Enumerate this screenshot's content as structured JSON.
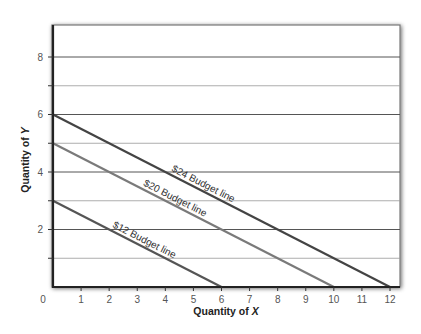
{
  "chart_data": {
    "type": "line",
    "title": "",
    "xlabel": "Quantity of X",
    "ylabel": "Quantity of Y",
    "xlim": [
      0,
      12
    ],
    "ylim": [
      0,
      9
    ],
    "x_ticks": [
      0,
      1,
      2,
      3,
      4,
      5,
      6,
      7,
      8,
      9,
      10,
      11,
      12
    ],
    "y_ticks": [
      2,
      4,
      6,
      8
    ],
    "grid": {
      "horizontal": true,
      "vertical": false,
      "y_values": [
        1,
        2,
        3,
        4,
        5,
        6,
        7,
        8
      ]
    },
    "legend": "none (inline labels)",
    "series": [
      {
        "name": "$24 Budget line",
        "x": [
          0,
          12
        ],
        "y": [
          6,
          0
        ],
        "color": "#444444",
        "label_at_x": 4.2
      },
      {
        "name": "$20 Budget line",
        "x": [
          0,
          10
        ],
        "y": [
          5,
          0
        ],
        "color": "#7a7a7a",
        "label_at_x": 3.2
      },
      {
        "name": "$12 Budget line",
        "x": [
          0,
          6
        ],
        "y": [
          3,
          0
        ],
        "color": "#555555",
        "label_at_x": 2.1
      }
    ]
  },
  "labels": {
    "x_axis_title": "Quantity of ",
    "x_axis_var": "X",
    "y_axis_title": "Quantity of ",
    "y_axis_var": "Y",
    "line_24": "$24 Budget line",
    "line_20": "$20 Budget line",
    "line_12": "$12 Budget line"
  }
}
